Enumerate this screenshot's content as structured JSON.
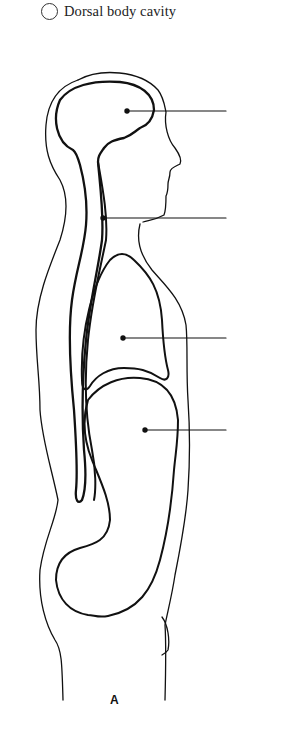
{
  "legend": {
    "items": [
      {
        "label": "Dorsal body cavity",
        "marker": "empty-circle"
      }
    ]
  },
  "figure": {
    "label": "A",
    "leader_lines": [
      {
        "name": "cranial-cavity",
        "dot": [
          127,
          111
        ],
        "end_x": 226
      },
      {
        "name": "vertebral-canal",
        "dot": [
          103,
          218
        ],
        "end_x": 226
      },
      {
        "name": "thoracic-cavity",
        "dot": [
          123,
          338
        ],
        "end_x": 226
      },
      {
        "name": "abdominopelvic-cavity",
        "dot": [
          145,
          430
        ],
        "end_x": 226
      }
    ]
  },
  "colors": {
    "stroke": "#111111",
    "background": "#ffffff"
  }
}
